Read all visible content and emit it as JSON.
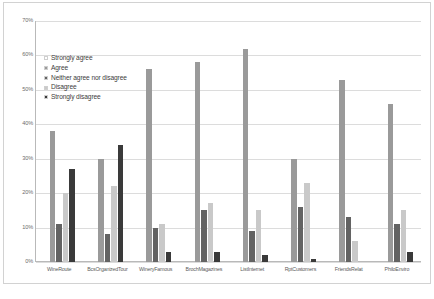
{
  "chart_data": {
    "type": "bar",
    "title": "",
    "subtitle": "",
    "xlabel": "",
    "ylabel": "",
    "ylim": [
      0,
      70
    ],
    "y_tick_labels": [
      "70%",
      "60%",
      "50%",
      "40%",
      "30%",
      "20%",
      "10%",
      "0%"
    ],
    "y_tick_values": [
      70,
      60,
      50,
      40,
      30,
      20,
      10,
      0
    ],
    "grid": true,
    "legend_position": "inside-upper-left",
    "categories": [
      "WineRoute",
      "BcsOrganizedTour",
      "WineryFamous",
      "BrochMagazines",
      "ListInternet",
      "RptCustomers",
      "FriendsRelat",
      "PhiloEnviro"
    ],
    "series": [
      {
        "name": "Strongly agree",
        "color": "#ffffff",
        "values": [
          0,
          0,
          0,
          0,
          0,
          0,
          0,
          0
        ]
      },
      {
        "name": "Agree",
        "color": "#9a9a9a",
        "values": [
          38,
          30,
          56,
          58,
          62,
          30,
          53,
          46
        ]
      },
      {
        "name": "Neither agree nor disagree",
        "color": "#636363",
        "values": [
          11,
          8,
          10,
          15,
          9,
          16,
          13,
          11
        ]
      },
      {
        "name": "Disagree",
        "color": "#c9c9c9",
        "values": [
          20,
          22,
          11,
          17,
          15,
          23,
          6,
          15
        ]
      },
      {
        "name": "Strongly disagree",
        "color": "#3a3a3a",
        "values": [
          27,
          34,
          3,
          3,
          2,
          1,
          0,
          3
        ]
      }
    ]
  }
}
